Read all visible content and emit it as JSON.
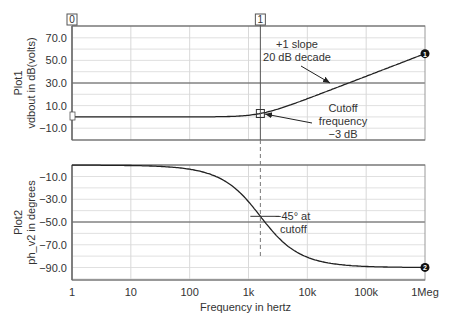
{
  "chart_data": [
    {
      "name": "Plot1",
      "type": "line",
      "title": "",
      "xlabel": "Frequency in hertz",
      "ylabel": "vdbout in dB(volts)",
      "plot_label": "Plot1",
      "xscale": "log",
      "xlim": [
        1,
        1000000
      ],
      "ylim": [
        -20,
        80
      ],
      "yticks": [
        70.0,
        50.0,
        30.0,
        10.0,
        -10.0
      ],
      "ytick_labels": [
        "70.0",
        "50.0",
        "30.0",
        "10.0",
        "−10.0"
      ],
      "grid": true,
      "series": [
        {
          "name": "vdbout",
          "marker_id": "1",
          "x": [
            1,
            10,
            100,
            300,
            1000,
            1591,
            3000,
            10000,
            100000,
            1000000
          ],
          "values": [
            0.0,
            0.0,
            0.0,
            0.2,
            1.5,
            3.0,
            6.0,
            16.0,
            36.0,
            56.0
          ]
        }
      ],
      "reference_lines": [
        30.0
      ],
      "annotations": [
        {
          "text": [
            "+1 slope",
            "20 dB decade"
          ],
          "x": 20000,
          "y": 30
        },
        {
          "text": [
            "Cutoff",
            "frequency",
            "−3 dB"
          ],
          "x": 1591,
          "y": 3
        }
      ]
    },
    {
      "name": "Plot2",
      "type": "line",
      "title": "",
      "xlabel": "Frequency in hertz",
      "ylabel": "ph_v2 in degrees",
      "plot_label": "Plot2",
      "xscale": "log",
      "xlim": [
        1,
        1000000
      ],
      "ylim": [
        -100,
        0
      ],
      "yticks": [
        -10.0,
        -30.0,
        -50.0,
        -70.0,
        -90.0
      ],
      "ytick_labels": [
        "−10.0",
        "−30.0",
        "−50.0",
        "−70.0",
        "−90.0"
      ],
      "grid": true,
      "series": [
        {
          "name": "ph_v2",
          "marker_id": "2",
          "x": [
            1,
            10,
            100,
            300,
            1000,
            1591,
            3000,
            10000,
            100000,
            1000000
          ],
          "values": [
            0.0,
            -0.4,
            -3.6,
            -10.7,
            -32.2,
            -45.0,
            -62.1,
            -80.9,
            -89.1,
            -89.9
          ]
        }
      ],
      "reference_lines": [
        -50.0
      ],
      "annotations": [
        {
          "text": [
            "−45° at",
            "cutoff"
          ],
          "x": 1591,
          "y": -45
        }
      ]
    }
  ],
  "x_axis": {
    "tick_labels": [
      "1",
      "10",
      "100",
      "1k",
      "10k",
      "100k",
      "1Meg"
    ],
    "label": "Frequency in hertz"
  },
  "plot1": {
    "label": "Plot1",
    "ylabel": "vdbout in dB(volts)",
    "yticks": [
      "70.0",
      "50.0",
      "30.0",
      "10.0",
      "−10.0"
    ],
    "annotation_slope": [
      "+1 slope",
      "20 dB decade"
    ],
    "annotation_cutoff": [
      "Cutoff",
      "frequency",
      "−3 dB"
    ],
    "trace_marker": "1"
  },
  "plot2": {
    "label": "Plot2",
    "ylabel": "ph_v2 in degrees",
    "yticks": [
      "−10.0",
      "−30.0",
      "−50.0",
      "−70.0",
      "−90.0"
    ],
    "annotation_phase": [
      "−45° at",
      "cutoff"
    ],
    "trace_marker": "2"
  },
  "cursors": {
    "cursor0_label": "0",
    "cursor1_label": "1",
    "cursor1_frequency_hz": 1591
  },
  "colors": {
    "frame": "#666666",
    "grid": "#d8d8d8",
    "trace": "#222222",
    "text": "#333333",
    "marker_fill": "#111111"
  }
}
